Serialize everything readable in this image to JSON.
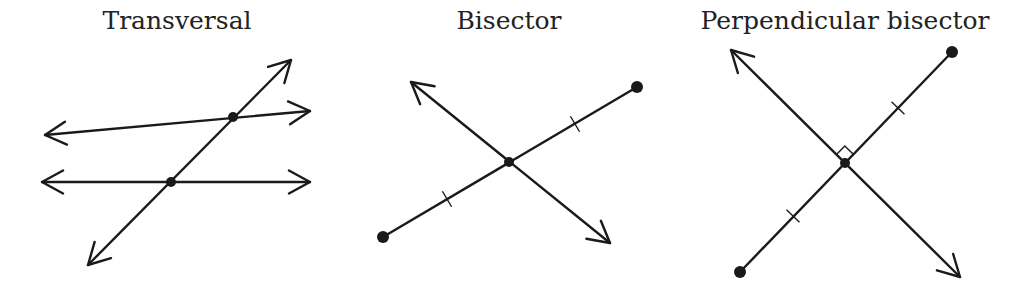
{
  "panels": [
    {
      "id": "transversal",
      "title": "Transversal",
      "title_center_x": 177,
      "lines": [
        {
          "name": "upper-line",
          "x1": 45,
          "y1": 135,
          "x2": 310,
          "y2": 111,
          "arrows": "both"
        },
        {
          "name": "lower-line",
          "x1": 42,
          "y1": 182,
          "x2": 310,
          "y2": 182,
          "arrows": "both"
        },
        {
          "name": "transversal-line",
          "x1": 88,
          "y1": 265,
          "x2": 291,
          "y2": 60,
          "arrows": "both"
        }
      ],
      "points": [
        {
          "name": "upper-intersection",
          "x": 233,
          "y": 117
        },
        {
          "name": "lower-intersection",
          "x": 171,
          "y": 182
        }
      ]
    },
    {
      "id": "bisector",
      "title": "Bisector",
      "title_center_x": 509,
      "segment": {
        "x1": 383,
        "y1": 237,
        "x2": 637,
        "y2": 87
      },
      "line": {
        "x1": 610,
        "y1": 243,
        "x2": 411,
        "y2": 82,
        "arrows": "both"
      },
      "midpoint": {
        "x": 509,
        "y": 162
      },
      "tick_marks": [
        {
          "x": 447,
          "y": 199
        },
        {
          "x": 575,
          "y": 124
        }
      ]
    },
    {
      "id": "perpendicular-bisector",
      "title": "Perpendicular bisector",
      "title_center_x": 845,
      "segment": {
        "x1": 740,
        "y1": 272,
        "x2": 952,
        "y2": 52
      },
      "line": {
        "x1": 960,
        "y1": 277,
        "x2": 731,
        "y2": 50,
        "arrows": "both"
      },
      "midpoint": {
        "x": 845,
        "y": 163
      },
      "tick_marks": [
        {
          "x": 793,
          "y": 216
        },
        {
          "x": 898,
          "y": 108
        }
      ],
      "right_angle_marker": true
    }
  ]
}
